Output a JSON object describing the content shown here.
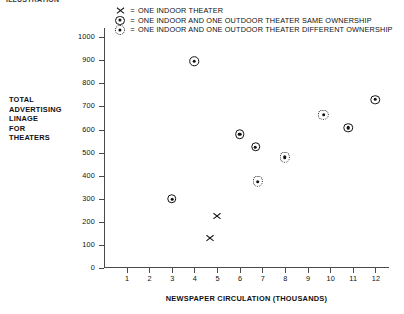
{
  "top_caption": "ILLUSTRATION",
  "legend": {
    "equals": "=",
    "items": [
      {
        "symbol": "x-marker",
        "label": "ONE INDOOR THEATER"
      },
      {
        "symbol": "circle-dot-marker",
        "label": "ONE INDOOR AND ONE OUTDOOR THEATER SAME OWNERSHIP"
      },
      {
        "symbol": "double-circle-dot-marker",
        "label": "ONE INDOOR AND ONE OUTDOOR THEATER DIFFERENT OWNERSHIP"
      }
    ]
  },
  "chart_data": {
    "type": "scatter",
    "title": "",
    "xlabel": "NEWSPAPER CIRCULATION (THOUSANDS)",
    "ylabel": "TOTAL ADVERTISING LINAGE FOR THEATERS",
    "ylabel_lines": [
      "TOTAL",
      "ADVERTISING",
      "LINAGE",
      "FOR",
      "THEATERS"
    ],
    "xlim": [
      0,
      12.6
    ],
    "ylim": [
      0,
      1040
    ],
    "xticks": [
      1,
      2,
      3,
      4,
      5,
      6,
      7,
      8,
      9,
      10,
      11,
      12
    ],
    "yticks": [
      0,
      100,
      200,
      300,
      400,
      500,
      600,
      700,
      800,
      900,
      1000
    ],
    "grid": false,
    "legend_position": "top",
    "series": [
      {
        "name": "ONE INDOOR THEATER",
        "marker": "x-marker",
        "points": [
          {
            "x": 5.0,
            "y": 225
          },
          {
            "x": 4.7,
            "y": 130
          }
        ]
      },
      {
        "name": "ONE INDOOR AND ONE OUTDOOR THEATER SAME OWNERSHIP",
        "marker": "circle-dot-marker",
        "points": [
          {
            "x": 4.0,
            "y": 895
          },
          {
            "x": 3.0,
            "y": 300
          },
          {
            "x": 6.0,
            "y": 580
          },
          {
            "x": 6.7,
            "y": 525
          },
          {
            "x": 10.8,
            "y": 608
          },
          {
            "x": 12.0,
            "y": 730
          }
        ]
      },
      {
        "name": "ONE INDOOR AND ONE OUTDOOR THEATER DIFFERENT OWNERSHIP",
        "marker": "double-circle-dot-marker",
        "points": [
          {
            "x": 6.8,
            "y": 375
          },
          {
            "x": 8.0,
            "y": 480
          },
          {
            "x": 9.7,
            "y": 665
          }
        ]
      }
    ]
  }
}
